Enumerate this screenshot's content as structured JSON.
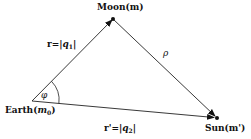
{
  "diagram": {
    "title": "",
    "nodes": [
      {
        "id": "earth",
        "label": "Earth",
        "sub": "(m0)",
        "x": 32,
        "y": 101
      },
      {
        "id": "moon",
        "label": "Moon(m)",
        "x": 113,
        "y": 19
      },
      {
        "id": "sun",
        "label": "Sun(m')",
        "x": 217,
        "y": 118
      }
    ],
    "edges": [
      {
        "from": "earth",
        "to": "moon",
        "label": "r=|q1|",
        "arrow": true
      },
      {
        "from": "moon",
        "to": "sun",
        "label": "ρ",
        "arrow": true
      },
      {
        "from": "earth",
        "to": "sun",
        "label": "r'=|q2|",
        "arrow": true
      }
    ],
    "angle": {
      "at": "earth",
      "label": "φ"
    }
  },
  "labels": {
    "moon": "Moon(m)",
    "sun": "Sun(m')",
    "earth_name": "Earth(",
    "earth_m": "m",
    "earth_sub": "0",
    "earth_close": ")",
    "r_prefix": "r=|",
    "r_q": "q",
    "r_sub": "1",
    "r_suffix": "|",
    "rp_prefix": "r'=|",
    "rp_q": "q",
    "rp_sub": "2",
    "rp_suffix": "|",
    "rho": "ρ",
    "phi": "φ"
  },
  "colors": {
    "line": "#222222",
    "text": "#111111",
    "background": "#ffffff"
  }
}
